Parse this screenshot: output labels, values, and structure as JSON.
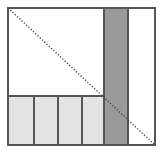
{
  "figure": {
    "title": "",
    "type": "geometric-diagram",
    "canvas": {
      "width": 162,
      "height": 152,
      "background": "#ffffff"
    },
    "colors": {
      "outline": "#000000",
      "frame_stroke": "#555555",
      "light_gray_fill": "#e3e3e3",
      "medium_gray_fill": "#9a9a9a",
      "white_fill": "#ffffff",
      "diagonal_dots": "#444444"
    },
    "frame": {
      "label": "bounding-square",
      "x": 8,
      "y": 8,
      "width": 147,
      "height": 137,
      "fill": "#ffffff",
      "stroke": "#555555",
      "stroke_width": 1.5
    },
    "band": {
      "label": "vertical-gray-band",
      "x": 104,
      "y": 8,
      "width": 24,
      "height": 137,
      "fill": "#9a9a9a",
      "stroke": "#555555",
      "stroke_width": 1.5
    },
    "bottom_boxes": {
      "label": "bottom-light-gray-boxes",
      "count": 4,
      "y": 96,
      "height": 49,
      "fill": "#e3e3e3",
      "stroke": "#555555",
      "stroke_width": 1.5,
      "boxes": [
        {
          "name": "box-1",
          "x": 8,
          "width": 26
        },
        {
          "name": "box-2",
          "x": 34,
          "width": 24
        },
        {
          "name": "box-3",
          "x": 58,
          "width": 24
        },
        {
          "name": "box-4",
          "x": 82,
          "width": 22
        }
      ]
    },
    "diagonal": {
      "label": "dotted-diagonal",
      "x1": 8,
      "y1": 8,
      "x2": 155,
      "y2": 145,
      "stroke": "#444444",
      "stroke_width": 1.4,
      "dash": "1.2 1.9"
    }
  }
}
